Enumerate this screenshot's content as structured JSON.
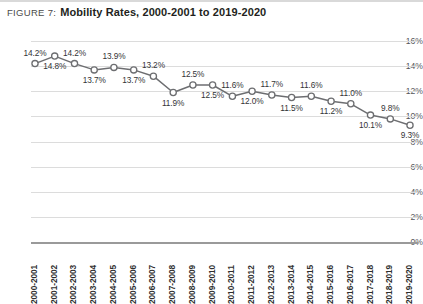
{
  "caption": {
    "figure_label": "FIGURE 7:",
    "title": "Mobility Rates, 2000-2001 to 2019-2020"
  },
  "colors": {
    "line": "#6d6e71",
    "marker_stroke": "#6d6e71",
    "marker_fill": "#ffffff",
    "gridline": "#dcdcdc",
    "axis": "#9a9a9a",
    "label_text": "#333436",
    "tick_text": "#2f2f2f"
  },
  "chart_data": {
    "type": "line",
    "title": "Mobility Rates, 2000-2001 to 2019-2020",
    "xlabel": "",
    "ylabel": "",
    "ylim": [
      0,
      16
    ],
    "ytick_labels": [
      "16%",
      "14%",
      "12%",
      "10%",
      "8%",
      "6%",
      "4%",
      "2%",
      "0%"
    ],
    "ytick_values": [
      16,
      14,
      12,
      10,
      8,
      6,
      4,
      2,
      0
    ],
    "grid": true,
    "legend": "none",
    "categories": [
      "2000-2001",
      "2001-2002",
      "2002-2003",
      "2003-2004",
      "2004-2005",
      "2005-2006",
      "2006-2007",
      "2007-2008",
      "2008-2009",
      "2009-2010",
      "2010-2011",
      "2011-2012",
      "2012-2013",
      "2013-2014",
      "2014-2015",
      "2015-2016",
      "2016-2017",
      "2017-2018",
      "2018-2019",
      "2019-2020"
    ],
    "values": [
      14.2,
      14.8,
      14.2,
      13.7,
      13.9,
      13.7,
      13.2,
      11.9,
      12.5,
      12.5,
      11.6,
      12.0,
      11.7,
      11.5,
      11.6,
      11.2,
      11.0,
      10.1,
      9.8,
      9.3
    ],
    "data_labels": [
      "14.2%",
      "14.8%",
      "14.2%",
      "13.7%",
      "13.9%",
      "13.7%",
      "13.2%",
      "11.9%",
      "12.5%",
      "12.5%",
      "11.6%",
      "12.0%",
      "11.7%",
      "11.5%",
      "11.6%",
      "11.2%",
      "11.0%",
      "10.1%",
      "9.8%",
      "9.3%"
    ],
    "label_positions": [
      "above",
      "below",
      "above",
      "below",
      "above",
      "below",
      "above",
      "below",
      "above",
      "below",
      "above",
      "below",
      "above",
      "below",
      "above",
      "below",
      "above",
      "below",
      "above",
      "below"
    ]
  }
}
